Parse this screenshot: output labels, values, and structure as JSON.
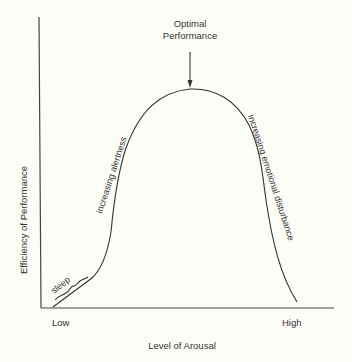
{
  "title": "Optimal Performance",
  "annotation": {
    "line1": "Optimal",
    "line2": "Performance"
  },
  "axes": {
    "x_label": "Level of Arousal",
    "y_label": "Efficiency of Performance",
    "x_low": "Low",
    "x_high": "High"
  },
  "curve_labels": {
    "sleep": "sleep",
    "rising": "increasing alertness",
    "falling": "increasing emotional disturbance"
  },
  "colors": {
    "background": "#fdfdf8",
    "ink": "#333333"
  }
}
